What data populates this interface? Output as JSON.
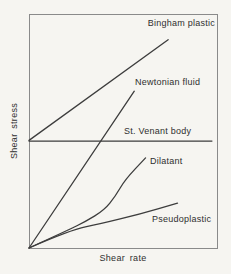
{
  "colors": {
    "background": "#f6f5f1",
    "frame": "#8a8a8a",
    "curve": "#3d3d3d",
    "text": "#2f2f2f"
  },
  "chart_data": {
    "type": "line",
    "title": "",
    "xlabel": "Shear rate",
    "ylabel": "Shear stress",
    "xlim": [
      0,
      1
    ],
    "ylim": [
      0,
      1
    ],
    "grid": false,
    "axes_numeric": false,
    "legend_position": "inline-labels",
    "note": "Qualitative rheology diagram; coordinates are normalized fractions of the plot area read from the figure.",
    "series": [
      {
        "name": "Bingham plastic",
        "shape": "straight",
        "points": [
          [
            0,
            0.46
          ],
          [
            0.74,
            0.89
          ]
        ]
      },
      {
        "name": "Newtonian fluid",
        "shape": "straight",
        "points": [
          [
            0,
            0
          ],
          [
            0.56,
            0.67
          ]
        ]
      },
      {
        "name": "St. Venant body",
        "shape": "straight",
        "points": [
          [
            0,
            0.457
          ],
          [
            0.973,
            0.457
          ]
        ]
      },
      {
        "name": "Dilatant",
        "shape": "concave-up",
        "points": [
          [
            0,
            0
          ],
          [
            0.21,
            0.077
          ],
          [
            0.3,
            0.113
          ],
          [
            0.4,
            0.162
          ],
          [
            0.46,
            0.222
          ],
          [
            0.51,
            0.291
          ],
          [
            0.62,
            0.385
          ]
        ]
      },
      {
        "name": "Pseudoplastic",
        "shape": "concave-down",
        "points": [
          [
            0,
            0
          ],
          [
            0.22,
            0.077
          ],
          [
            0.38,
            0.103
          ],
          [
            0.59,
            0.145
          ],
          [
            0.79,
            0.192
          ]
        ]
      }
    ],
    "plot_area_px": {
      "left": 29,
      "top": 14,
      "width": 188,
      "height": 234
    }
  }
}
